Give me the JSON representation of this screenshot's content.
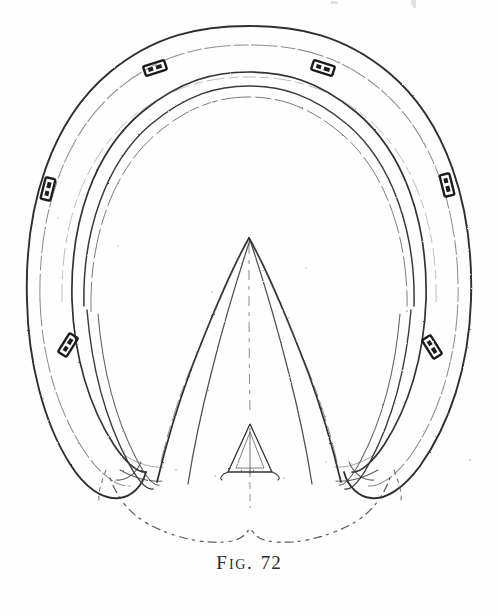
{
  "plate": {
    "width": 498,
    "height": 616,
    "background_color": "#fefefe",
    "ink_color": "#2b2b2b",
    "ink_light_color": "#6a6a6a",
    "caption_lead": "F",
    "caption_small": "IG",
    "caption_dot": ".",
    "caption_number": "72",
    "caption_full": "FIG. 72"
  },
  "figure": {
    "elements": [
      {
        "name": "horseshoe-outer-edge",
        "label": "Outer edge of horseshoe"
      },
      {
        "name": "horseshoe-inner-edge",
        "label": "Inner edge of horseshoe"
      },
      {
        "name": "horseshoe-crease-line",
        "label": "Fullering crease"
      },
      {
        "name": "hoof-sole-outline",
        "label": "Sole outline inside shoe"
      },
      {
        "name": "frog-body",
        "label": "Frog"
      },
      {
        "name": "frog-central-cleft",
        "label": "Central cleft of frog"
      },
      {
        "name": "bars-of-hoof",
        "label": "Bars of the hoof"
      },
      {
        "name": "heel-bulbs-outline",
        "label": "Heel bulbs, dotted outline"
      },
      {
        "name": "nail-heads",
        "label": "Nail heads in the shoe"
      }
    ],
    "nails": [
      {
        "id": "nail-toe-left",
        "x": 155,
        "y": 68,
        "angle": -18
      },
      {
        "id": "nail-toe-right",
        "x": 323,
        "y": 68,
        "angle": 18
      },
      {
        "id": "nail-quarter-left",
        "x": 48,
        "y": 189,
        "angle": -76
      },
      {
        "id": "nail-quarter-right",
        "x": 447,
        "y": 185,
        "angle": 76
      },
      {
        "id": "nail-heel-left",
        "x": 68,
        "y": 345,
        "angle": -58
      },
      {
        "id": "nail-heel-right",
        "x": 432,
        "y": 347,
        "angle": 58
      }
    ],
    "top_remnants": [
      {
        "x": 331,
        "y": 1,
        "w": 7,
        "h": 3
      },
      {
        "x": 411,
        "y": 0,
        "w": 5,
        "h": 5
      },
      {
        "x": 413,
        "y": 5,
        "w": 3,
        "h": 3
      }
    ]
  }
}
